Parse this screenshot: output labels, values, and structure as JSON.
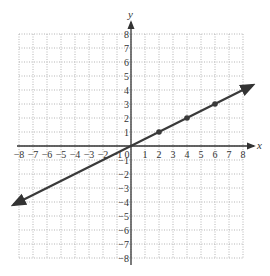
{
  "chart_data": {
    "type": "line",
    "title": "",
    "xlabel": "x",
    "ylabel": "y",
    "xlim": [
      -8,
      8
    ],
    "ylim": [
      -8,
      8
    ],
    "grid": true,
    "grid_style": "dotted",
    "x_ticks": [
      -8,
      -7,
      -6,
      -5,
      -4,
      -3,
      -2,
      -1,
      0,
      1,
      2,
      3,
      4,
      5,
      6,
      7,
      8
    ],
    "y_ticks": [
      -8,
      -7,
      -6,
      -5,
      -4,
      -3,
      -2,
      -1,
      1,
      2,
      3,
      4,
      5,
      6,
      7,
      8
    ],
    "x_tick_labels": [
      "−8",
      "−7",
      "−6",
      "−5",
      "−4",
      "−3",
      "−2",
      "−1",
      "0",
      "1",
      "2",
      "3",
      "4",
      "5",
      "6",
      "7",
      "8"
    ],
    "y_tick_labels": [
      "−8",
      "−7",
      "−6",
      "−5",
      "−4",
      "−3",
      "−2",
      "−1",
      "1",
      "2",
      "3",
      "4",
      "5",
      "6",
      "7",
      "8"
    ],
    "series": [
      {
        "name": "y = x/2",
        "equation": "y = 0.5x",
        "slope": 0.5,
        "intercept": 0,
        "line_extent_x": [
          -8.4,
          8.7
        ],
        "arrows_both_ends": true,
        "color": "#3a3a3a"
      }
    ],
    "points": [
      {
        "x": 0,
        "y": 0
      },
      {
        "x": 2,
        "y": 1
      },
      {
        "x": 4,
        "y": 2
      },
      {
        "x": 6,
        "y": 3
      }
    ],
    "colors": {
      "axis": "#333333",
      "grid": "#b5b5b5",
      "line": "#3a3a3a",
      "point": "#3a3a3a"
    }
  }
}
